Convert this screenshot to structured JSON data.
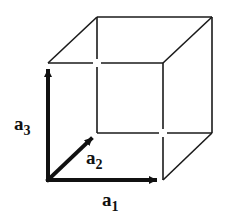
{
  "diagram": {
    "type": "unit-cell-cube",
    "colors": {
      "edge": "#1a1a1a",
      "vector": "#111111",
      "background": "#ffffff"
    },
    "cube": {
      "front": {
        "bl": [
          48,
          180
        ],
        "br": [
          163,
          180
        ],
        "tr": [
          163,
          63
        ],
        "tl": [
          48,
          63
        ]
      },
      "back": {
        "bl": [
          97,
          133
        ],
        "br": [
          212,
          133
        ],
        "tr": [
          212,
          17
        ],
        "tl": [
          97,
          17
        ]
      }
    },
    "vectors": [
      {
        "id": "a1",
        "base": "a",
        "sub": "1",
        "from": [
          48,
          180
        ],
        "to": [
          163,
          180
        ]
      },
      {
        "id": "a2",
        "base": "a",
        "sub": "2",
        "from": [
          48,
          180
        ],
        "to": [
          97,
          133
        ]
      },
      {
        "id": "a3",
        "base": "a",
        "sub": "3",
        "from": [
          48,
          180
        ],
        "to": [
          48,
          63
        ]
      }
    ]
  }
}
